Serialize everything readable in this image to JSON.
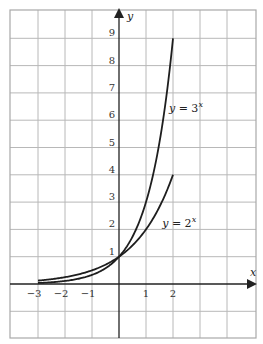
{
  "chart_data": {
    "type": "line",
    "title": "",
    "xlabel": "x",
    "ylabel": "y",
    "xlim": [
      -4,
      5
    ],
    "ylim": [
      -2,
      10
    ],
    "grid": true,
    "x_ticks": [
      -3,
      -2,
      -1,
      1,
      2
    ],
    "x_tick_labels": [
      "−3",
      "−2",
      "−1",
      "1",
      "2"
    ],
    "y_ticks": [
      1,
      2,
      3,
      4,
      5,
      6,
      7,
      8,
      9
    ],
    "y_tick_labels": [
      "1",
      "2",
      "3",
      "4",
      "5",
      "6",
      "7",
      "8",
      "9"
    ],
    "series": [
      {
        "name": "y = 3^x",
        "label_base": "y = 3",
        "label_exp": "x",
        "base": 3,
        "x": [
          -3,
          -2,
          -1,
          0,
          1,
          2
        ],
        "values": [
          0.037,
          0.111,
          0.333,
          1,
          3,
          9
        ],
        "label_pos": [
          1.85,
          6.3
        ]
      },
      {
        "name": "y = 2^x",
        "label_base": "y = 2",
        "label_exp": "x",
        "base": 2,
        "x": [
          -3,
          -2,
          -1,
          0,
          1,
          2
        ],
        "values": [
          0.125,
          0.25,
          0.5,
          1,
          2,
          4
        ],
        "label_pos": [
          1.6,
          2.1
        ]
      }
    ],
    "colors": {
      "grid": "#b8b8b8",
      "border": "#a8a8a8",
      "axis": "#222222",
      "curve": "#1e1e1e"
    }
  }
}
